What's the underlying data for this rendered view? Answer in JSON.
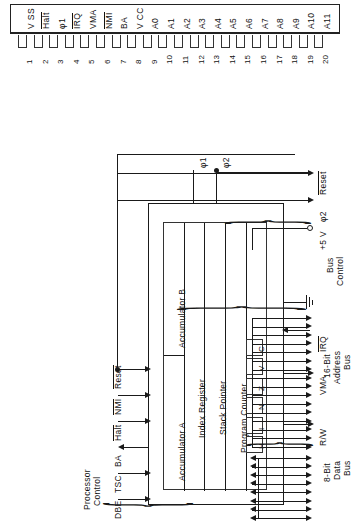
{
  "figure": {
    "type": "microprocessor-block-diagram",
    "orientation": "rotated-90-ccw",
    "ink_color": "#1a1a1a"
  },
  "pin_header": {
    "pins": [
      {
        "number": "1",
        "label": "V SS",
        "overbar": false
      },
      {
        "number": "2",
        "label": "Halt",
        "overbar": true
      },
      {
        "number": "3",
        "label": "φ1",
        "overbar": false
      },
      {
        "number": "4",
        "label": "IRQ",
        "overbar": true
      },
      {
        "number": "5",
        "label": "VMA",
        "overbar": false
      },
      {
        "number": "6",
        "label": "NMI",
        "overbar": true
      },
      {
        "number": "7",
        "label": "BA",
        "overbar": false
      },
      {
        "number": "8",
        "label": "V CC",
        "overbar": false
      },
      {
        "number": "9",
        "label": "A0",
        "overbar": false
      },
      {
        "number": "10",
        "label": "A1",
        "overbar": false
      },
      {
        "number": "11",
        "label": "A2",
        "overbar": false
      },
      {
        "number": "12",
        "label": "A3",
        "overbar": false
      },
      {
        "number": "13",
        "label": "A4",
        "overbar": false
      },
      {
        "number": "14",
        "label": "A5",
        "overbar": false
      },
      {
        "number": "15",
        "label": "A6",
        "overbar": false
      },
      {
        "number": "16",
        "label": "A7",
        "overbar": false
      },
      {
        "number": "17",
        "label": "A8",
        "overbar": false
      },
      {
        "number": "18",
        "label": "A9",
        "overbar": false
      },
      {
        "number": "19",
        "label": "A10",
        "overbar": false
      },
      {
        "number": "20",
        "label": "A11",
        "overbar": false
      }
    ]
  },
  "registers": {
    "rows": [
      {
        "name": "accumulator-a",
        "label": "Accumulator A"
      },
      {
        "name": "accumulator-b",
        "label": "Accumulator B"
      },
      {
        "name": "index-register",
        "label": "Index Register"
      },
      {
        "name": "stack-pointer",
        "label": "Stack Pointer"
      },
      {
        "name": "program-counter",
        "label": "Program Counter"
      }
    ],
    "condition_codes": [
      "H",
      "I",
      "N",
      "Z",
      "V",
      "C"
    ]
  },
  "processor_control": {
    "group_label_line1": "Processor",
    "group_label_line2": "Control",
    "signals": [
      {
        "name": "dbe",
        "label": "DBE",
        "overbar": false,
        "direction": "in"
      },
      {
        "name": "tsc",
        "label": "TSC",
        "overbar": false,
        "direction": "in"
      },
      {
        "name": "ba",
        "label": "BA",
        "overbar": false,
        "direction": "out"
      },
      {
        "name": "halt",
        "label": "Halt",
        "overbar": true,
        "direction": "in"
      },
      {
        "name": "nmi",
        "label": "NMI",
        "overbar": true,
        "direction": "in"
      },
      {
        "name": "reset",
        "label": "Reset",
        "overbar": true,
        "direction": "in"
      }
    ]
  },
  "bus_control": {
    "group_label_line1": "Bus",
    "group_label_line2": "Control",
    "signals": [
      {
        "name": "rw",
        "label": "R/W",
        "overbar": false,
        "direction": "out"
      },
      {
        "name": "vma",
        "label": "VMA",
        "overbar": false,
        "direction": "out"
      },
      {
        "name": "irq",
        "label": "IRQ",
        "overbar": true,
        "direction": "in"
      },
      {
        "name": "gnd",
        "label": "",
        "overbar": false,
        "direction": "ground"
      },
      {
        "name": "vcc",
        "label": "+5 V",
        "overbar": false,
        "direction": "supply"
      },
      {
        "name": "phi2",
        "label": "φ2",
        "overbar": false,
        "direction": "out"
      },
      {
        "name": "reset",
        "label": "Reset",
        "overbar": true,
        "direction": "out"
      }
    ]
  },
  "clocks": [
    {
      "name": "phi1",
      "label": "φ1"
    },
    {
      "name": "phi2",
      "label": "φ2"
    }
  ],
  "address_bus": {
    "line1": "16-Bit",
    "line2": "Address",
    "line3": "Bus",
    "width": 16,
    "direction": "out"
  },
  "data_bus": {
    "line1": "8-Bit",
    "line2": "Data",
    "line3": "Bus",
    "width": 8,
    "direction": "bidirectional"
  }
}
